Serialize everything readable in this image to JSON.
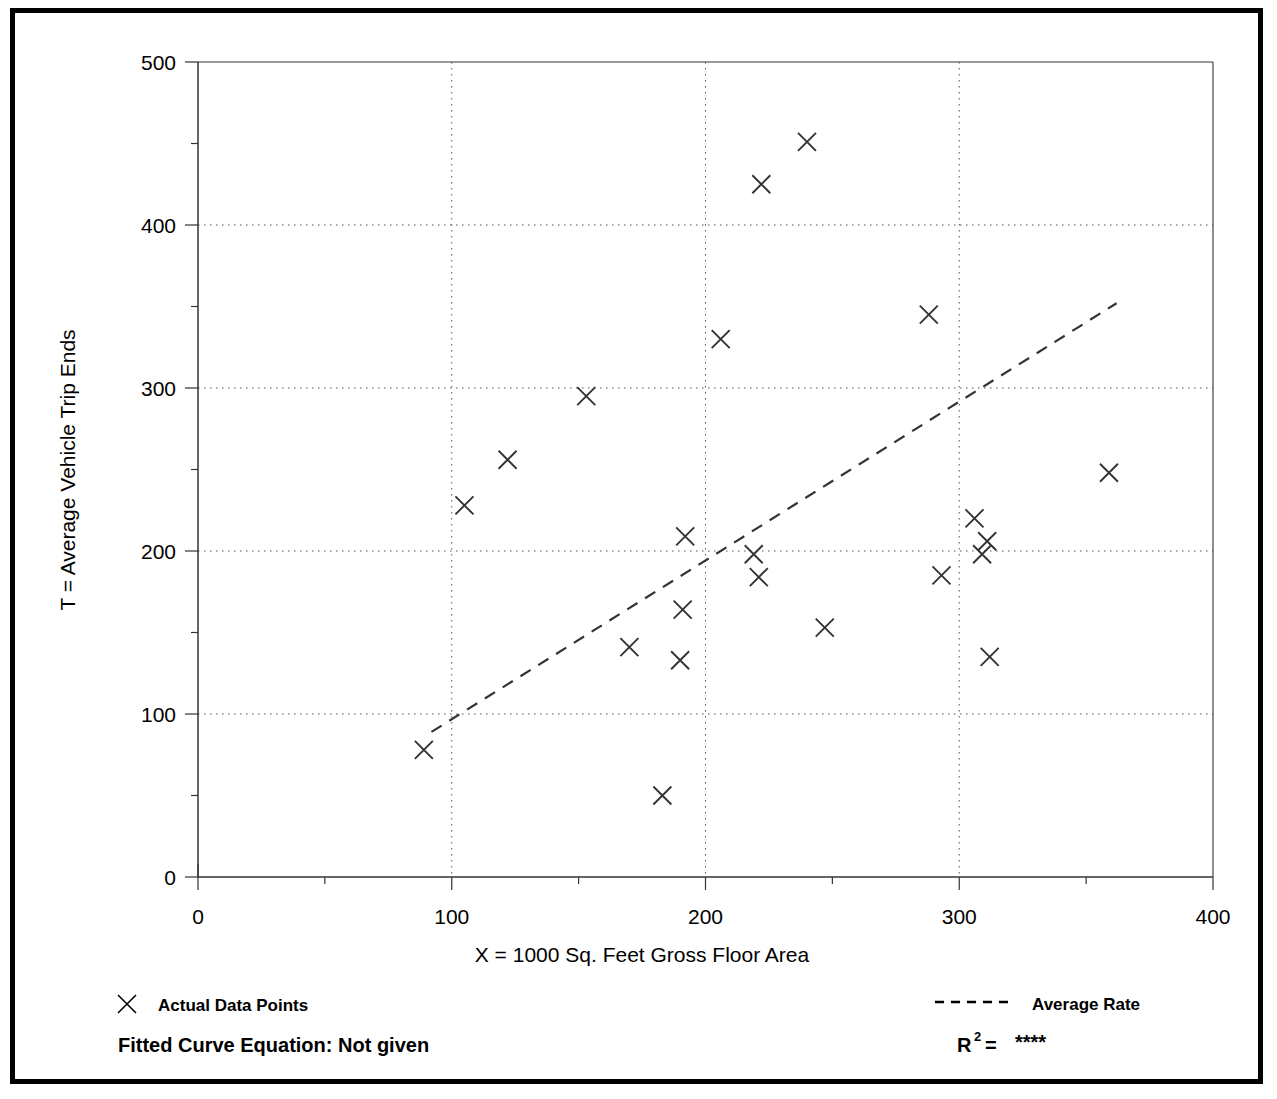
{
  "figure": {
    "cut_off_heading": "",
    "frame_color": "#000000"
  },
  "axis": {
    "x_title": "X = 1000 Sq. Feet Gross Floor Area",
    "y_title": "T = Average Vehicle Trip Ends",
    "x_ticks": [
      "0",
      "100",
      "200",
      "300",
      "400"
    ],
    "y_ticks": [
      "0",
      "100",
      "200",
      "300",
      "400",
      "500"
    ]
  },
  "legend": {
    "data_points_marker": "x-marker-icon",
    "data_points_label": "Actual Data Points",
    "average_rate_marker": "dashed-line-icon",
    "average_rate_label": "Average Rate"
  },
  "footer": {
    "fitted_curve_label": "Fitted Curve Equation:  Not given",
    "r2_base": "R",
    "r2_exponent": "2",
    "r2_equals": " = ",
    "r2_value": "****"
  },
  "chart_data": {
    "type": "scatter",
    "title": "",
    "xlabel": "X = 1000 Sq. Feet Gross Floor Area",
    "ylabel": "T = Average Vehicle Trip Ends",
    "xlim": [
      0,
      400
    ],
    "ylim": [
      0,
      500
    ],
    "x_major_tick": 100,
    "x_minor_tick": 50,
    "y_major_tick": 100,
    "y_minor_tick": 50,
    "grid": "dotted-major-gridlines",
    "legend_position": "below-plot",
    "series": [
      {
        "name": "Actual Data Points",
        "marker": "x",
        "points": [
          [
            89,
            78
          ],
          [
            105,
            228
          ],
          [
            122,
            256
          ],
          [
            153,
            295
          ],
          [
            170,
            141
          ],
          [
            183,
            50
          ],
          [
            190,
            133
          ],
          [
            191,
            164
          ],
          [
            192,
            209
          ],
          [
            206,
            330
          ],
          [
            219,
            198
          ],
          [
            221,
            184
          ],
          [
            222,
            425
          ],
          [
            240,
            451
          ],
          [
            247,
            153
          ],
          [
            288,
            345
          ],
          [
            293,
            185
          ],
          [
            306,
            220
          ],
          [
            309,
            198
          ],
          [
            311,
            206
          ],
          [
            312,
            135
          ],
          [
            359,
            248
          ]
        ]
      },
      {
        "name": "Average Rate",
        "style": "dashed",
        "line": [
          [
            92,
            89
          ],
          [
            362,
            352
          ]
        ]
      }
    ]
  }
}
